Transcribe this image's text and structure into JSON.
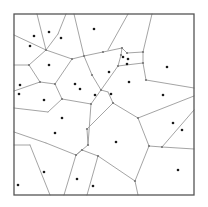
{
  "diagram": {
    "type": "voronoi",
    "frame": {
      "x": 14,
      "y": 14,
      "width": 180,
      "height": 181
    },
    "colors": {
      "frame": "#555555",
      "edge": "#9a9a9a",
      "site": "#1a1a1a",
      "background": "#ffffff"
    },
    "sites": [
      [
        34,
        36
      ],
      [
        49,
        32
      ],
      [
        61,
        38
      ],
      [
        30,
        46
      ],
      [
        94,
        29
      ],
      [
        49,
        65
      ],
      [
        20,
        85
      ],
      [
        19,
        94
      ],
      [
        75,
        84
      ],
      [
        80,
        89
      ],
      [
        44,
        100
      ],
      [
        95,
        95
      ],
      [
        123,
        57
      ],
      [
        128,
        59
      ],
      [
        127,
        64
      ],
      [
        109,
        72
      ],
      [
        167,
        67
      ],
      [
        129,
        82
      ],
      [
        111,
        94
      ],
      [
        163,
        95
      ],
      [
        62,
        118
      ],
      [
        55,
        133
      ],
      [
        44,
        172
      ],
      [
        18,
        185
      ],
      [
        77,
        179
      ],
      [
        93,
        186
      ],
      [
        116,
        142
      ],
      [
        173,
        123
      ],
      [
        182,
        130
      ],
      [
        178,
        170
      ]
    ],
    "edges": [
      [
        14,
        35,
        46,
        50
      ],
      [
        37,
        14,
        46,
        50
      ],
      [
        66,
        14,
        58,
        34
      ],
      [
        58,
        34,
        46,
        50
      ],
      [
        46,
        50,
        72,
        59
      ],
      [
        72,
        59,
        84,
        56
      ],
      [
        84,
        56,
        103,
        52
      ],
      [
        103,
        52,
        122,
        48
      ],
      [
        74,
        14,
        84,
        56
      ],
      [
        128,
        14,
        108,
        50
      ],
      [
        152,
        14,
        143,
        52
      ],
      [
        122,
        48,
        127,
        53
      ],
      [
        127,
        53,
        143,
        52
      ],
      [
        122,
        48,
        121,
        55
      ],
      [
        121,
        55,
        118,
        66
      ],
      [
        118,
        66,
        143,
        63
      ],
      [
        143,
        52,
        143,
        63
      ],
      [
        143,
        63,
        146,
        80
      ],
      [
        146,
        80,
        194,
        88
      ],
      [
        14,
        65,
        29,
        65
      ],
      [
        29,
        65,
        46,
        50
      ],
      [
        29,
        65,
        40,
        82
      ],
      [
        40,
        82,
        55,
        84
      ],
      [
        55,
        84,
        72,
        59
      ],
      [
        55,
        84,
        62,
        99
      ],
      [
        14,
        91,
        40,
        82
      ],
      [
        84,
        56,
        92,
        75
      ],
      [
        92,
        75,
        101,
        90
      ],
      [
        101,
        90,
        118,
        66
      ],
      [
        101,
        90,
        91,
        104
      ],
      [
        91,
        104,
        62,
        99
      ],
      [
        62,
        99,
        48,
        112
      ],
      [
        48,
        112,
        14,
        108
      ],
      [
        14,
        132,
        46,
        143
      ],
      [
        46,
        143,
        76,
        155
      ],
      [
        76,
        155,
        88,
        145
      ],
      [
        88,
        145,
        91,
        104
      ],
      [
        88,
        145,
        87,
        129
      ],
      [
        87,
        129,
        113,
        103
      ],
      [
        113,
        103,
        108,
        92
      ],
      [
        108,
        92,
        101,
        90
      ],
      [
        113,
        103,
        138,
        118
      ],
      [
        138,
        118,
        194,
        96
      ],
      [
        138,
        118,
        149,
        146
      ],
      [
        149,
        146,
        162,
        147
      ],
      [
        162,
        147,
        194,
        149
      ],
      [
        162,
        147,
        194,
        110
      ],
      [
        149,
        146,
        135,
        181
      ],
      [
        135,
        181,
        138,
        195
      ],
      [
        135,
        181,
        98,
        156
      ],
      [
        98,
        156,
        82,
        150
      ],
      [
        82,
        150,
        76,
        155
      ],
      [
        98,
        156,
        87,
        195
      ],
      [
        76,
        155,
        64,
        195
      ],
      [
        30,
        145,
        50,
        195
      ],
      [
        14,
        145,
        30,
        145
      ]
    ],
    "vertices": [
      [
        46,
        50
      ],
      [
        72,
        59
      ],
      [
        84,
        56
      ],
      [
        103,
        52
      ],
      [
        122,
        48
      ],
      [
        127,
        53
      ],
      [
        143,
        52
      ],
      [
        121,
        55
      ],
      [
        118,
        66
      ],
      [
        143,
        63
      ],
      [
        146,
        80
      ],
      [
        29,
        65
      ],
      [
        40,
        82
      ],
      [
        55,
        84
      ],
      [
        62,
        99
      ],
      [
        92,
        75
      ],
      [
        101,
        90
      ],
      [
        91,
        104
      ],
      [
        88,
        145
      ],
      [
        87,
        129
      ],
      [
        113,
        103
      ],
      [
        138,
        118
      ],
      [
        149,
        146
      ],
      [
        162,
        147
      ],
      [
        135,
        181
      ],
      [
        98,
        156
      ],
      [
        76,
        155
      ],
      [
        82,
        150
      ]
    ]
  }
}
